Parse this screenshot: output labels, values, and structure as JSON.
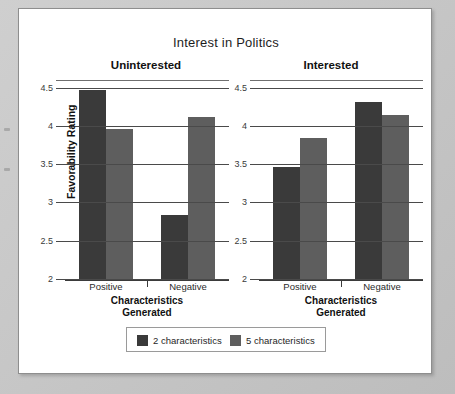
{
  "figure": {
    "title": "Interest in Politics",
    "yaxis_title": "Favorability Rating",
    "xaxis_title_line1": "Characteristics",
    "xaxis_title_line2": "Generated"
  },
  "panels": [
    {
      "header": "Uninterested"
    },
    {
      "header": "Interested"
    }
  ],
  "yticks": [
    "4.5",
    "4",
    "3.5",
    "3",
    "2.5",
    "2"
  ],
  "xticks": [
    "Positive",
    "Negative"
  ],
  "legend": {
    "items": [
      {
        "label": "2 characteristics",
        "color": "#3a3a3a"
      },
      {
        "label": "5 characteristics",
        "color": "#5e5e5e"
      }
    ]
  },
  "chart_data": {
    "type": "bar",
    "title": "Interest in Politics",
    "xlabel": "Characteristics Generated",
    "ylabel": "Favorability Rating",
    "ylim": [
      2,
      4.6
    ],
    "yticks": [
      2,
      2.5,
      3,
      3.5,
      4,
      4.5
    ],
    "grid": true,
    "legend_position": "bottom",
    "categories": [
      "Positive",
      "Negative"
    ],
    "panels": [
      {
        "name": "Uninterested",
        "series": [
          {
            "name": "2 characteristics",
            "color": "#3a3a3a",
            "values": [
              4.48,
              2.85
            ]
          },
          {
            "name": "5 characteristics",
            "color": "#5e5e5e",
            "values": [
              3.97,
              4.13
            ]
          }
        ]
      },
      {
        "name": "Interested",
        "series": [
          {
            "name": "2 characteristics",
            "color": "#3a3a3a",
            "values": [
              3.48,
              4.33
            ]
          },
          {
            "name": "5 characteristics",
            "color": "#5e5e5e",
            "values": [
              3.85,
              4.15
            ]
          }
        ]
      }
    ]
  }
}
